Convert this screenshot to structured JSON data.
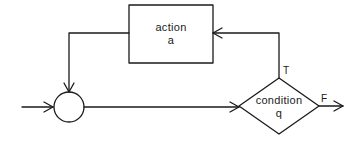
{
  "diagram": {
    "type": "flowchart-loop",
    "stroke_color": "#1a1a1a",
    "background": "#ffffff",
    "nodes": {
      "action": {
        "shape": "rectangle",
        "line1": "action",
        "line2": "a"
      },
      "junction": {
        "shape": "circle"
      },
      "condition": {
        "shape": "diamond",
        "line1": "condition",
        "line2": "q"
      }
    },
    "edge_labels": {
      "true": "T",
      "false": "F"
    },
    "edges": [
      {
        "from": "entry",
        "to": "junction"
      },
      {
        "from": "junction",
        "to": "condition"
      },
      {
        "from": "condition",
        "to": "action",
        "label": "T"
      },
      {
        "from": "action",
        "to": "junction"
      },
      {
        "from": "condition",
        "to": "exit",
        "label": "F"
      }
    ]
  }
}
